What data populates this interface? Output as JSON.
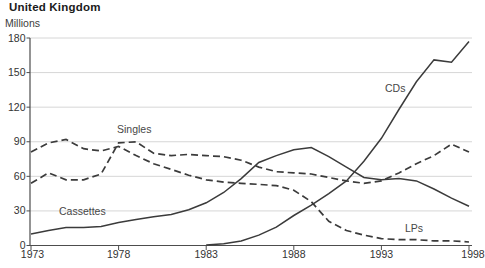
{
  "page": {
    "title": "United Kingdom",
    "units_label": "Millions"
  },
  "chart_data": {
    "type": "line",
    "title": "United Kingdom",
    "ylabel": "Millions",
    "xlabel": "",
    "x": [
      1973,
      1974,
      1975,
      1976,
      1977,
      1978,
      1979,
      1980,
      1981,
      1982,
      1983,
      1984,
      1985,
      1986,
      1987,
      1988,
      1989,
      1990,
      1991,
      1992,
      1993,
      1994,
      1995,
      1996,
      1997,
      1998
    ],
    "ylim": [
      0,
      180
    ],
    "yticks": [
      0,
      30,
      60,
      90,
      120,
      150,
      180
    ],
    "xticks": [
      1973,
      1978,
      1983,
      1988,
      1993,
      1998
    ],
    "grid": true,
    "legend_position": "inline-labels",
    "series": [
      {
        "name": "Singles",
        "style": "dashed",
        "values": [
          54,
          63,
          57,
          57,
          62,
          89,
          90,
          80,
          78,
          79,
          78,
          77,
          74,
          68,
          64,
          63,
          62,
          59,
          56,
          54,
          56,
          63,
          71,
          78,
          88,
          81
        ]
      },
      {
        "name": "LPs",
        "style": "dashed",
        "values": [
          81,
          89,
          92,
          84,
          82,
          86,
          78,
          71,
          66,
          61,
          57,
          55,
          54,
          53,
          52,
          48,
          38,
          21,
          13,
          9,
          6,
          5,
          5,
          4,
          4,
          3
        ]
      },
      {
        "name": "Cassettes",
        "style": "solid",
        "values": [
          10,
          13,
          15.5,
          15.5,
          16.5,
          20,
          22.5,
          25,
          27,
          31,
          37,
          46,
          58,
          72,
          78,
          83,
          85,
          77,
          68,
          59,
          57,
          58,
          56,
          49,
          41,
          34
        ]
      },
      {
        "name": "CDs",
        "style": "solid",
        "values": [
          null,
          null,
          null,
          null,
          null,
          null,
          null,
          null,
          null,
          null,
          0.5,
          1.5,
          4,
          9,
          16,
          26,
          35,
          45,
          56,
          73,
          93,
          118,
          142,
          161,
          159,
          177
        ]
      }
    ],
    "annotations": [
      {
        "text": "Singles",
        "x_px": 117,
        "y_px": 133
      },
      {
        "text": "Cassettes",
        "x_px": 59,
        "y_px": 215
      },
      {
        "text": "CDs",
        "x_px": 385,
        "y_px": 92
      },
      {
        "text": "LPs",
        "x_px": 405,
        "y_px": 232
      }
    ],
    "colors": {
      "line": "#3b3b3b",
      "grid": "#d6d6d6",
      "axis": "#4d4d4d",
      "text": "#333333",
      "label": "#474747"
    }
  }
}
